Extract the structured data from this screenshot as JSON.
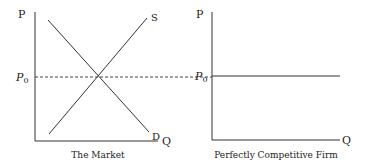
{
  "left_panel": {
    "title": "The Market",
    "y_axis_label": "P",
    "x_axis_label": "Q",
    "price_label": "P",
    "price_subscript": "0",
    "supply_label": "S",
    "demand_label": "D"
  },
  "right_panel": {
    "title": "Perfectly Competitive Firm",
    "y_axis_label": "P",
    "x_axis_label": "Q",
    "price_label": "P",
    "price_subscript": "0"
  },
  "colors": {
    "line": "#333333",
    "dashed": "#444444",
    "background": "#ffffff"
  }
}
